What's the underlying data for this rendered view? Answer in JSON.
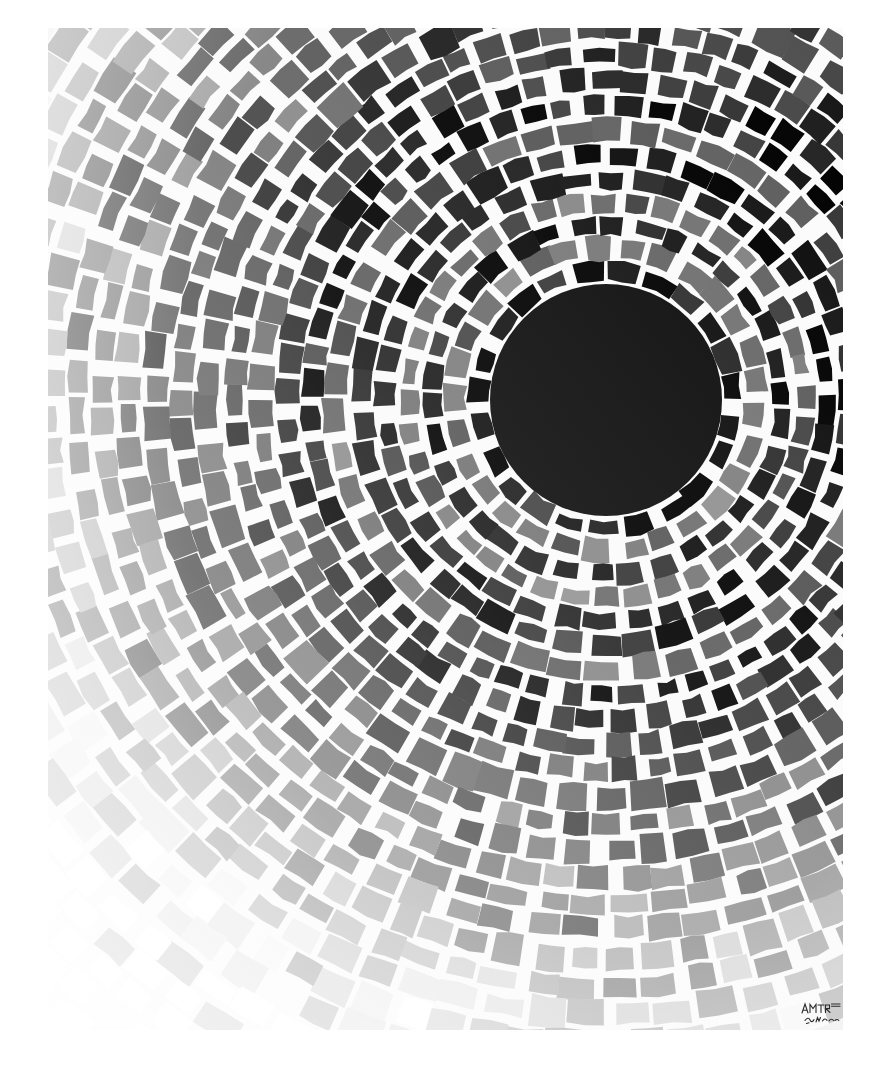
{
  "artwork": {
    "title": "Concentric Mosaic Rings",
    "medium_appearance": "black-and-white reproduction of a painted stone-mosaic composition",
    "background_color": "#ffffff",
    "plate": {
      "x": 48,
      "y": 28,
      "width": 795,
      "height": 1002
    },
    "composition": {
      "center_x": 606,
      "center_y": 400,
      "core_radius": 116,
      "core_color": "#0d0d0d",
      "mortar_color": "#fbfbfb",
      "mortar_width": 3.2,
      "ring_spacing_base": 26,
      "ring_count": 34,
      "angular_jitter": 0.22,
      "radial_jitter": 0.3
    },
    "palette": {
      "black": "#121212",
      "near_black": "#1d1d1d",
      "dark_gray": "#3a3a3a",
      "mid_dark_gray": "#4f4f4f",
      "mid_gray": "#6e6e6e",
      "light_mid_gray": "#8d8d8d",
      "light_gray": "#b4b4b4",
      "pale_gray": "#d2d2d2",
      "very_pale_gray": "#e4e4e4",
      "near_white": "#f0f0f0",
      "paper_white": "#f7f7f7"
    },
    "bands": [
      {
        "index": 0,
        "from_radius": 116,
        "to_radius": 140,
        "tone": "black",
        "color": "#141414",
        "label": "inner black collar"
      },
      {
        "index": 1,
        "from_radius": 140,
        "to_radius": 160,
        "tone": "mid_gray",
        "color": "#6e6e6e",
        "label": "first grey halo"
      },
      {
        "index": 2,
        "from_radius": 160,
        "to_radius": 196,
        "tone": "black",
        "color": "#141414",
        "label": "second black ring"
      },
      {
        "index": 3,
        "from_radius": 196,
        "to_radius": 220,
        "tone": "mid_gray",
        "color": "#6b6b6b",
        "label": "second grey halo"
      },
      {
        "index": 4,
        "from_radius": 220,
        "to_radius": 262,
        "tone": "black",
        "color": "#161616",
        "label": "third black ring"
      },
      {
        "index": 5,
        "from_radius": 262,
        "to_radius": 286,
        "tone": "mid_dark_gray",
        "color": "#5a5a5a",
        "label": "third grey halo"
      },
      {
        "index": 6,
        "from_radius": 286,
        "to_radius": 330,
        "tone": "near_black",
        "color": "#1f1f1f",
        "label": "fourth black ring"
      },
      {
        "index": 7,
        "from_radius": 330,
        "to_radius": 372,
        "tone": "dark_gray",
        "color": "#3d3d3d",
        "label": "dark grey band"
      },
      {
        "index": 8,
        "from_radius": 372,
        "to_radius": 420,
        "tone": "mid_dark_gray",
        "color": "#4c4c4c",
        "label": "mid dark band"
      },
      {
        "index": 9,
        "from_radius": 420,
        "to_radius": 470,
        "tone": "mid_gray",
        "color": "#5f5f5f",
        "label": "mid band"
      },
      {
        "index": 10,
        "from_radius": 470,
        "to_radius": 530,
        "tone": "light_mid_gray",
        "color": "#7d7d7d",
        "label": "outer mid band"
      },
      {
        "index": 11,
        "from_radius": 530,
        "to_radius": 600,
        "tone": "light_gray",
        "color": "#a2a2a2",
        "label": "light band"
      },
      {
        "index": 12,
        "from_radius": 600,
        "to_radius": 680,
        "tone": "pale_gray",
        "color": "#c4c4c4",
        "label": "pale band"
      },
      {
        "index": 13,
        "from_radius": 680,
        "to_radius": 780,
        "tone": "very_pale_gray",
        "color": "#dcdcdc",
        "label": "very pale band"
      },
      {
        "index": 14,
        "from_radius": 780,
        "to_radius": 980,
        "tone": "near_white",
        "color": "#ebebeb",
        "label": "outermost near-white band"
      }
    ],
    "tone_variation": {
      "note": "individual tiles deviate from their band tone; darker accent tiles are scattered throughout every ring",
      "accent_probability": 0.3,
      "accent_delta": -46,
      "highlight_probability": 0.16,
      "highlight_delta": 34
    },
    "lighting": {
      "note": "overall tonal gradient: darkest toward upper-right of the core, lightest toward lower-left corner",
      "gradient_axis_degrees": 225,
      "lightening_strength": 0.55
    }
  },
  "signature": {
    "present": true,
    "legible": false,
    "reading": "illegible handwritten artist signature",
    "x": 800,
    "y": 1000,
    "width": 46,
    "height": 26,
    "color": "#2a2a2a"
  }
}
